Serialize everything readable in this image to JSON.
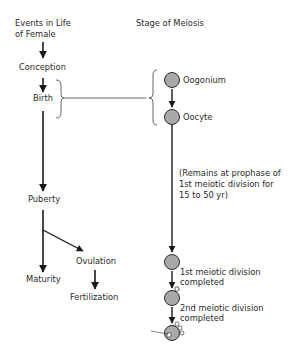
{
  "headers": {
    "left_line1": "Events in Life",
    "left_line2": "of Female",
    "right": "Stage of Meiosis"
  },
  "events": {
    "conception": "Conception",
    "birth": "Birth",
    "puberty": "Puberty",
    "maturity": "Maturity",
    "ovulation": "Ovulation",
    "fertilization": "Fertilization"
  },
  "stages": {
    "oogonium": "Oogonium",
    "oocyte": "Oocyte",
    "note_line1": "(Remains at prophase of",
    "note_line2": "1st meiotic division for",
    "note_line3": "15 to 50 yr)",
    "first_div_line1": "1st meiotic  division",
    "first_div_line2": "completed",
    "second_div_line1": "2nd meiotic division",
    "second_div_line2": "completed"
  },
  "colors": {
    "cell_fill": "#a9a9a9",
    "line": "#1a1a1a",
    "text": "#2a2a2a"
  }
}
